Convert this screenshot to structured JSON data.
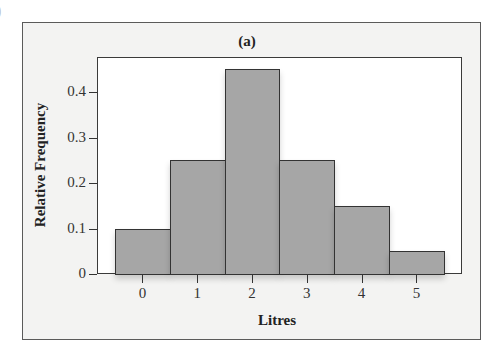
{
  "chart_data": {
    "type": "bar",
    "title": "(a)",
    "xlabel": "Litres",
    "ylabel": "Relative Frequency",
    "categories": [
      "0",
      "1",
      "2",
      "3",
      "4",
      "5"
    ],
    "values": [
      0.1,
      0.25,
      0.45,
      0.25,
      0.15,
      0.05
    ],
    "yticks": [
      "0",
      "0.1",
      "0.2",
      "0.3",
      "0.4"
    ],
    "ytick_values": [
      0,
      0.1,
      0.2,
      0.3,
      0.4
    ],
    "ylim": [
      0,
      0.47
    ],
    "grid": false,
    "legend": null,
    "bar_color": "#a6a6a6",
    "histogram": true
  }
}
